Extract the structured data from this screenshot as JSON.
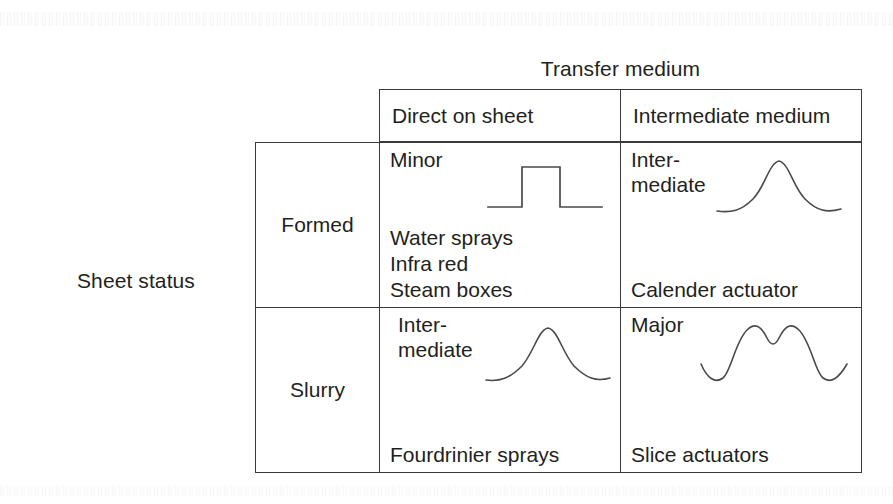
{
  "axes": {
    "column_axis_title": "Transfer medium",
    "row_axis_title": "Sheet\nstatus",
    "column_headers": [
      "Direct on sheet",
      "Intermediate medium"
    ],
    "row_headers": [
      "Formed",
      "Slurry"
    ]
  },
  "cells": {
    "formed_direct": {
      "severity": "Minor",
      "waveform": "square-pulse",
      "actuators": "Water sprays\n Infra red\nSteam boxes"
    },
    "formed_intermediate": {
      "severity": "Inter-\nmediate",
      "waveform": "gaussian-peak",
      "actuators": "Calender actuator"
    },
    "slurry_direct": {
      "severity": " Inter-\nmediate",
      "waveform": "gaussian-peak",
      "actuators": "Fourdrinier sprays"
    },
    "slurry_intermediate": {
      "severity": "Major",
      "waveform": "bimodal-peak",
      "actuators": "Slice actuators"
    }
  },
  "colors": {
    "border": "#3a3a3a",
    "text": "#231f20",
    "curve": "#4a4a4a",
    "background": "#ffffff"
  }
}
